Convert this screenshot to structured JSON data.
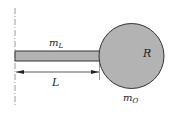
{
  "diagram": {
    "labels": {
      "rod_mass": "m",
      "rod_mass_sub": "L",
      "length": "L",
      "radius": "R",
      "disk_mass": "m",
      "disk_mass_sub": "O"
    },
    "colors": {
      "fill": "#b3b3b3",
      "stroke": "#333333",
      "axis": "#888888"
    }
  }
}
